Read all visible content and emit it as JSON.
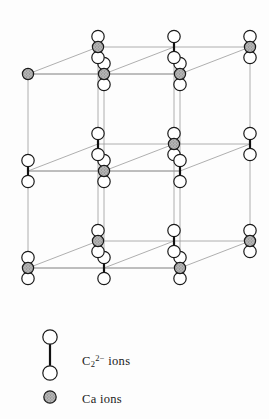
{
  "figure": {
    "name": "calcium-carbide-crystal-structure",
    "colors": {
      "background": "#fdfdfd",
      "lattice_line": "#9a9a9a",
      "lattice_line_dark": "#6f6f6f",
      "atom_outline": "#1a1a1a",
      "carbon_fill": "#ffffff",
      "calcium_fill": "#b8b8b8",
      "calcium_speckle": "#7d7d7d",
      "bond": "#111111"
    },
    "geometry": {
      "cell_origin_x": 28,
      "cell_origin_y": 74,
      "axis_a_dx": 152,
      "axis_a_dy": 0,
      "axis_b_dx": 70,
      "axis_b_dy": -27,
      "axis_c_dx": 0,
      "axis_c_dy": 97,
      "carbon_radius": 6.2,
      "calcium_radius": 5.6,
      "bond_half_length": 10.5,
      "cells_stacked": 2
    }
  },
  "legend": {
    "items": [
      {
        "id": "carbide",
        "marker": "dumbbell-pair-icon",
        "label_html": "C<sub>2</sub><sup>2&#8722;</sup> ions",
        "label_plain": "C2 2- ions",
        "species": "carbide",
        "marker_x": 50,
        "marker_top_y": 337,
        "marker_bottom_y": 373
      },
      {
        "id": "calcium",
        "marker": "calcium-sphere-icon",
        "label_html": "Ca ions",
        "label_plain": "Ca ions",
        "species": "calcium",
        "marker_x": 50,
        "marker_y": 397
      }
    ]
  },
  "lattice": {
    "carbide_sites": [
      {
        "u": 1,
        "v": 0,
        "w": 0
      },
      {
        "u": 0,
        "v": 1,
        "w": 0
      },
      {
        "u": 2,
        "v": 0,
        "w": 0
      },
      {
        "u": 1,
        "v": 1,
        "w": 0
      },
      {
        "u": 0,
        "v": 0,
        "w": 1
      },
      {
        "u": 1,
        "v": 0,
        "w": 1
      },
      {
        "u": 2,
        "v": 1,
        "w": 0
      },
      {
        "u": 0,
        "v": 1,
        "w": 1
      },
      {
        "u": 1,
        "v": 1,
        "w": 1
      },
      {
        "u": 2,
        "v": 0,
        "w": 1
      },
      {
        "u": 2,
        "v": 1,
        "w": 1
      },
      {
        "u": 0,
        "v": 0,
        "w": 2
      },
      {
        "u": 1,
        "v": 0,
        "w": 2
      },
      {
        "u": 2,
        "v": 0,
        "w": 2
      },
      {
        "u": 0,
        "v": 1,
        "w": 2
      },
      {
        "u": 1,
        "v": 1,
        "w": 2
      },
      {
        "u": 2,
        "v": 1,
        "w": 2
      }
    ],
    "calcium_sites": [
      {
        "u": 0,
        "v": 0,
        "w": 0
      },
      {
        "u": 2,
        "v": 1,
        "w": 0
      },
      {
        "u": 1,
        "v": 0,
        "w": 1
      },
      {
        "u": 0,
        "v": 1,
        "w": 0
      },
      {
        "u": 2,
        "v": 0,
        "w": 0
      },
      {
        "u": 1,
        "v": 1,
        "w": 1
      },
      {
        "u": 0,
        "v": 0,
        "w": 2
      },
      {
        "u": 2,
        "v": 1,
        "w": 2
      },
      {
        "u": 1,
        "v": 0,
        "w": 0
      },
      {
        "u": 0,
        "v": 1,
        "w": 2
      },
      {
        "u": 2,
        "v": 0,
        "w": 2
      }
    ]
  }
}
